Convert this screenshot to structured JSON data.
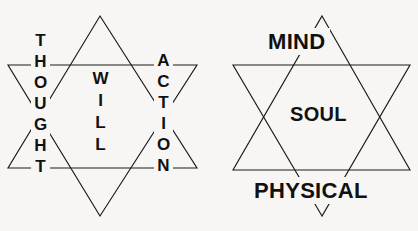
{
  "diagram": {
    "background_color": "#f7f6f4",
    "line_color": "#1a1a1a",
    "text_color": "#111111",
    "stars": [
      {
        "name": "left-star",
        "shape": "hexagram",
        "labels": {
          "left": "THOUGHT",
          "center": "WILL",
          "right": "ACTION"
        },
        "orientation": "vertical-stacked-letters",
        "geometry": {
          "top_apex": [
            100,
            16
          ],
          "bottom_apex": [
            100,
            216
          ],
          "upper_horizontal_y": 65,
          "lower_horizontal_y": 168,
          "left_x": 8,
          "right_x": 197
        }
      },
      {
        "name": "right-star",
        "shape": "hexagram",
        "labels": {
          "top": "MIND",
          "center": "SOUL",
          "bottom": "PHYSICAL"
        },
        "orientation": "horizontal-text",
        "geometry": {
          "top_apex": [
            322,
            16
          ],
          "bottom_apex": [
            322,
            216
          ],
          "upper_horizontal_y": 65,
          "lower_horizontal_y": 170,
          "left_x": 233,
          "right_x": 410
        }
      }
    ]
  }
}
